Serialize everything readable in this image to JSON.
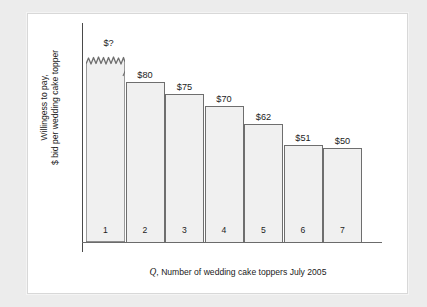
{
  "axis": {
    "y_label_line1": "Willingess to pay,",
    "y_label_line2": "$ bid per wedding cake topper",
    "x_caption_prefix": "Q",
    "x_caption_rest": ", Number of wedding cake toppers July 2005"
  },
  "chart_data": {
    "type": "bar",
    "title": "",
    "subtitle": "",
    "xlabel": "Q, Number of wedding cake toppers July 2005",
    "ylabel": "Willingess to pay, $ bid per wedding cake topper",
    "grid": false,
    "legend": "none",
    "axis_break": true,
    "axis_break_note": "Bar 1 is drawn with a jagged broken top; its value is unknown and labelled \"$?\"",
    "ylim": [
      0,
      100
    ],
    "categories": [
      "1",
      "2",
      "3",
      "4",
      "5",
      "6",
      "7"
    ],
    "values": [
      null,
      80,
      75,
      70,
      62,
      51,
      50
    ],
    "data_labels": [
      "$?",
      "$80",
      "$75",
      "$70",
      "$62",
      "$51",
      "$50"
    ],
    "bars": [
      {
        "index": "1",
        "label": "$?",
        "value": null,
        "broken_top": true,
        "pixel_top": 39
      },
      {
        "index": "2",
        "label": "$80",
        "value": 80,
        "broken_top": false,
        "pixel_top": 68
      },
      {
        "index": "3",
        "label": "$75",
        "value": 75,
        "broken_top": false,
        "pixel_top": 80
      },
      {
        "index": "4",
        "label": "$70",
        "value": 70,
        "broken_top": false,
        "pixel_top": 92
      },
      {
        "index": "5",
        "label": "$62",
        "value": 62,
        "broken_top": false,
        "pixel_top": 110
      },
      {
        "index": "6",
        "label": "$51",
        "value": 51,
        "broken_top": false,
        "pixel_top": 131
      },
      {
        "index": "7",
        "label": "$50",
        "value": 50,
        "broken_top": false,
        "pixel_top": 134
      }
    ],
    "colors": {
      "bar_fill": "#f0f0f0",
      "bar_stroke": "#6e6e6e",
      "axis": "#4a4a4a",
      "text": "#1c1c1c",
      "panel": "#ffffff",
      "page_background": "#ececec"
    }
  }
}
